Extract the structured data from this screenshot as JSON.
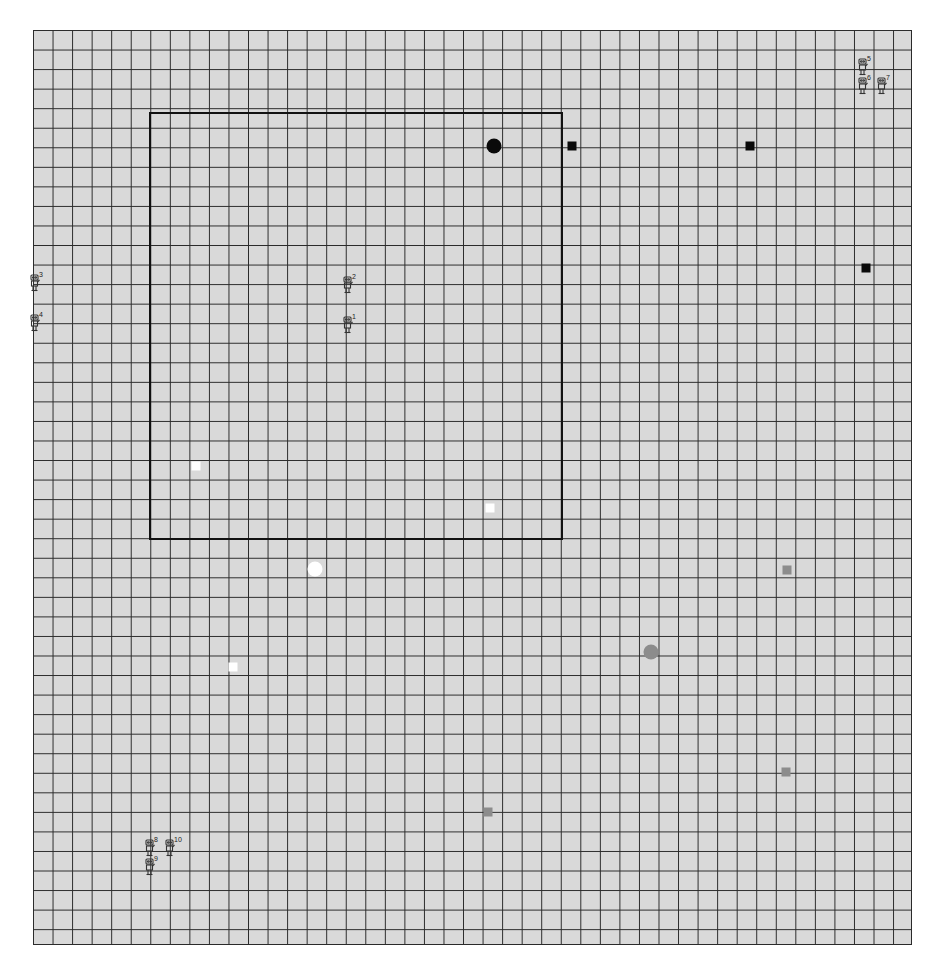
{
  "figure": {
    "grid": {
      "columns": 45,
      "rows": 46,
      "cell_px": 19.55,
      "background": "#d9d9d9",
      "line_color": "#2a2a2a"
    },
    "region": {
      "label": "rectangular-region",
      "border_color": "#111111"
    },
    "markers": [
      {
        "kind": "circle",
        "color": "black",
        "x": 494,
        "y": 146
      },
      {
        "kind": "square",
        "color": "black",
        "x": 572,
        "y": 146
      },
      {
        "kind": "square",
        "color": "black",
        "x": 750,
        "y": 146
      },
      {
        "kind": "square",
        "color": "black",
        "x": 866,
        "y": 268
      },
      {
        "kind": "square",
        "color": "white",
        "x": 196,
        "y": 466
      },
      {
        "kind": "square",
        "color": "white",
        "x": 490,
        "y": 508
      },
      {
        "kind": "circle",
        "color": "white",
        "x": 315,
        "y": 569
      },
      {
        "kind": "square",
        "color": "white",
        "x": 233,
        "y": 667
      },
      {
        "kind": "square",
        "color": "gray",
        "x": 787,
        "y": 570
      },
      {
        "kind": "circle",
        "color": "gray",
        "x": 651,
        "y": 652
      },
      {
        "kind": "square",
        "color": "gray",
        "x": 786,
        "y": 772
      },
      {
        "kind": "square",
        "color": "gray",
        "x": 488,
        "y": 812
      }
    ],
    "robots": [
      {
        "id": "3",
        "x": 38,
        "y": 283
      },
      {
        "id": "4",
        "x": 38,
        "y": 323
      },
      {
        "id": "2",
        "x": 351,
        "y": 285
      },
      {
        "id": "1",
        "x": 351,
        "y": 325
      },
      {
        "id": "5",
        "x": 866,
        "y": 67
      },
      {
        "id": "6",
        "x": 866,
        "y": 86
      },
      {
        "id": "7",
        "x": 885,
        "y": 86
      },
      {
        "id": "8",
        "x": 153,
        "y": 848
      },
      {
        "id": "10",
        "x": 173,
        "y": 848
      },
      {
        "id": "9",
        "x": 153,
        "y": 867
      }
    ],
    "caption": ""
  }
}
